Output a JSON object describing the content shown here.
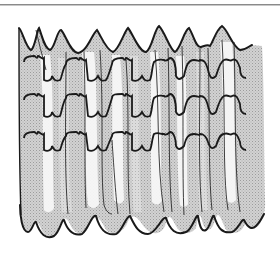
{
  "figure": {
    "alt": "Line illustration of shirred fabric showing a wavy top edge, three horizontal rows of gathering stitches, vertical folds and a wavy bottom hem",
    "stitch_rows": 3,
    "colors": {
      "ink": "#1a1a1a",
      "shade": "#c9c9c9",
      "shade_light": "#dcdcdc",
      "highlight": "#f6f6f6",
      "rule": "#8a8a8a"
    }
  }
}
